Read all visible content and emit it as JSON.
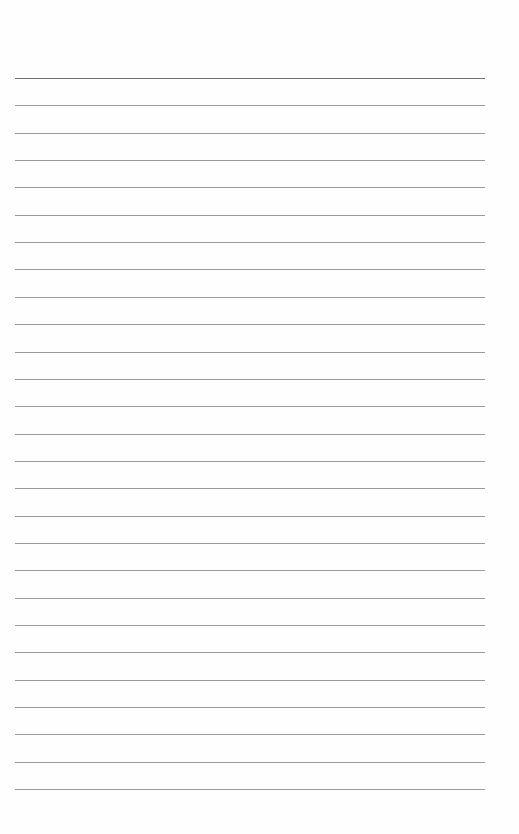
{
  "page": {
    "type": "blank lined paper",
    "background_color": "#fefefe",
    "ruling": {
      "line_count": 27,
      "first_line_y": 78,
      "line_spacing": 27.35,
      "left": 15,
      "right": 485,
      "line_color": "#9a9a9a",
      "header_line_color": "#6e6e6e"
    }
  }
}
